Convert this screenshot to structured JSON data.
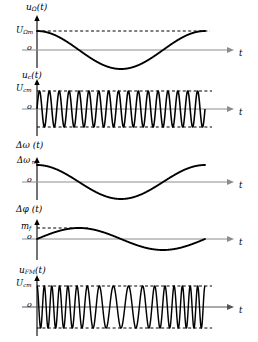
{
  "figure": {
    "width": 258,
    "height": 342,
    "background": "#ffffff",
    "curve_color": "#000000",
    "axis_color": "#808080",
    "dashed_color": "#000000"
  },
  "panels": [
    {
      "id": "modulating-signal",
      "ylabel_main": "u",
      "ylabel_sub": "Ω",
      "ylabel_arg": "(t)",
      "amplitude_label_main": "U",
      "amplitude_label_sub": "Ωm",
      "origin_label": "o",
      "time_label": "t",
      "waveform": "cosine",
      "cycles": 1,
      "phase_deg": 0,
      "has_upper_dash": true,
      "has_lower_dash": false
    },
    {
      "id": "carrier-signal",
      "ylabel_main": "u",
      "ylabel_sub": "c",
      "ylabel_arg": "(t)",
      "amplitude_label_main": "U",
      "amplitude_label_sub": "cm",
      "origin_label": "o",
      "time_label": "t",
      "waveform": "sine-carrier",
      "cycles": 17,
      "phase_deg": 0,
      "has_upper_dash": true,
      "has_lower_dash": true
    },
    {
      "id": "frequency-deviation",
      "ylabel_main": "Δω",
      "ylabel_sub": "",
      "ylabel_arg": " (t)",
      "amplitude_label_main": "Δω",
      "amplitude_label_sub": "m",
      "origin_label": "o",
      "time_label": "t",
      "waveform": "cosine",
      "cycles": 1,
      "phase_deg": 0,
      "has_upper_dash": false,
      "has_lower_dash": false
    },
    {
      "id": "phase-deviation",
      "ylabel_main": "Δφ",
      "ylabel_sub": "",
      "ylabel_arg": " (t)",
      "amplitude_label_main": "m",
      "amplitude_label_sub": "f",
      "origin_label": "o",
      "time_label": "t",
      "waveform": "sine",
      "cycles": 1,
      "phase_deg": 0,
      "has_upper_dash": true,
      "has_lower_dash": false
    },
    {
      "id": "fm-signal",
      "ylabel_main": "u",
      "ylabel_sub": "FM",
      "ylabel_arg": "(t)",
      "amplitude_label_main": "U",
      "amplitude_label_sub": "cm",
      "origin_label": "o",
      "time_label": "t",
      "waveform": "fm",
      "cycles": 17,
      "modulation_index": 6.0,
      "has_upper_dash": true,
      "has_lower_dash": true
    }
  ],
  "chart_data": {
    "type": "line",
    "xlabel": "t",
    "ylabel": "amplitude",
    "plot_left_px": 37,
    "plot_right_px": 205,
    "arrow_end_px": 232,
    "series": [
      {
        "name": "u_Ω(t) modulating signal",
        "panel": "modulating-signal",
        "expression": "U_Ωm * cos(Ωt)",
        "amplitude": 1.0,
        "periods_shown": 1,
        "peak_label": "U_Ωm",
        "zero_label": "o",
        "x_axis_label": "t"
      },
      {
        "name": "u_c(t) carrier signal",
        "panel": "carrier-signal",
        "expression": "U_cm * sin(ω_c t)",
        "amplitude": 1.0,
        "periods_shown": 17,
        "peak_label": "U_cm",
        "zero_label": "o",
        "x_axis_label": "t"
      },
      {
        "name": "Δω(t) instantaneous frequency deviation",
        "panel": "frequency-deviation",
        "expression": "Δω_m * cos(Ωt)",
        "amplitude": 1.0,
        "periods_shown": 1,
        "peak_label": "Δω_m",
        "zero_label": "o",
        "x_axis_label": "t"
      },
      {
        "name": "Δφ(t) instantaneous phase deviation",
        "panel": "phase-deviation",
        "expression": "m_f * sin(Ωt)",
        "amplitude": 1.0,
        "periods_shown": 1,
        "peak_label": "m_f",
        "zero_label": "o",
        "x_axis_label": "t"
      },
      {
        "name": "u_FM(t) frequency-modulated output",
        "panel": "fm-signal",
        "expression": "U_cm * cos(ω_c t + m_f sin(Ωt))",
        "amplitude": 1.0,
        "carrier_periods": 17,
        "peak_label": "U_cm",
        "zero_label": "o",
        "x_axis_label": "t"
      }
    ]
  }
}
